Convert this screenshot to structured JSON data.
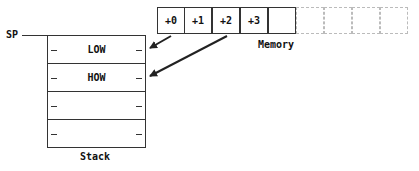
{
  "diagram": {
    "sp_label": "SP",
    "stack": {
      "label": "Stack",
      "rows": [
        {
          "label": "LOW"
        },
        {
          "label": "HOW"
        },
        {
          "label": ""
        },
        {
          "label": ""
        }
      ]
    },
    "memory": {
      "label": "Memory",
      "cells": [
        {
          "label": "+0",
          "style": "solid"
        },
        {
          "label": "+1",
          "style": "solid"
        },
        {
          "label": "+2",
          "style": "solid"
        },
        {
          "label": "+3",
          "style": "solid"
        },
        {
          "label": "",
          "style": "solid"
        },
        {
          "label": "",
          "style": "faint"
        },
        {
          "label": "",
          "style": "faint"
        },
        {
          "label": "",
          "style": "faint"
        },
        {
          "label": "",
          "style": "faint"
        }
      ]
    },
    "arrows": [
      {
        "from": "memory +0",
        "to": "stack LOW"
      },
      {
        "from": "memory +2",
        "to": "stack HOW"
      }
    ]
  }
}
